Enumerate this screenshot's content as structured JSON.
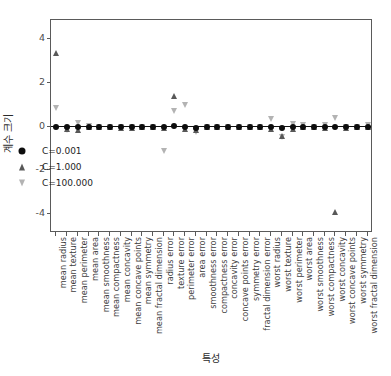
{
  "chart_data": {
    "type": "scatter",
    "title": "",
    "xlabel": "특성",
    "ylabel": "계수 크기",
    "ylim": [
      -4.85,
      4.85
    ],
    "yticks": [
      4,
      2,
      0,
      -2,
      -4
    ],
    "grid": false,
    "legend_position": "lower left",
    "zero_reference_line": true,
    "categories": [
      "mean radius",
      "mean texture",
      "mean perimeter",
      "mean area",
      "mean smoothness",
      "mean compactness",
      "mean concavity",
      "mean concave points",
      "mean symmetry",
      "mean fractal dimension",
      "radius error",
      "texture error",
      "perimeter error",
      "area error",
      "smoothness error",
      "compactness error",
      "concavity error",
      "concave points error",
      "symmetry error",
      "fractal dimension error",
      "worst radius",
      "worst texture",
      "worst perimeter",
      "worst area",
      "worst smoothness",
      "worst compactness",
      "worst concavity",
      "worst concave points",
      "worst symmetry",
      "worst fractal dimension"
    ],
    "series": [
      {
        "name": "C=0.001",
        "marker": "circle",
        "color": "#0d0d0d",
        "values": [
          -0.02,
          -0.03,
          -0.03,
          -0.02,
          0.0,
          0.0,
          -0.01,
          -0.01,
          0.0,
          0.0,
          0.0,
          0.03,
          0.0,
          -0.05,
          0.0,
          0.0,
          0.0,
          0.0,
          0.0,
          0.0,
          -0.03,
          -0.05,
          -0.03,
          -0.03,
          0.0,
          0.0,
          -0.01,
          -0.01,
          0.0,
          0.0
        ]
      },
      {
        "name": "C=1.000",
        "marker": "triangle-up",
        "color": "#585858",
        "values": [
          3.35,
          -0.12,
          -0.18,
          0.0,
          -0.02,
          -0.04,
          -0.06,
          -0.05,
          -0.03,
          0.0,
          -0.05,
          1.4,
          -0.1,
          -0.15,
          -0.02,
          -0.02,
          -0.02,
          -0.02,
          -0.02,
          0.0,
          -0.1,
          -0.45,
          -0.12,
          0.0,
          -0.03,
          -0.06,
          -3.9,
          -0.07,
          -0.04,
          -0.02
        ]
      },
      {
        "name": "C=100.000",
        "marker": "triangle-down",
        "color": "#b3b3b3",
        "values": [
          0.85,
          -0.15,
          0.15,
          0.04,
          0.0,
          0.0,
          0.0,
          0.0,
          0.0,
          0.0,
          -1.1,
          0.7,
          1.0,
          -0.25,
          0.0,
          0.0,
          0.0,
          0.0,
          0.0,
          0.0,
          0.35,
          -0.5,
          0.1,
          0.05,
          0.0,
          0.05,
          0.38,
          0.0,
          0.0,
          0.08
        ]
      }
    ]
  },
  "legend": {
    "entries": [
      {
        "label": "C=0.001",
        "marker": "circle",
        "color": "#0d0d0d"
      },
      {
        "label": "C=1.000",
        "marker": "triangle-up",
        "color": "#585858"
      },
      {
        "label": "C=100.000",
        "marker": "triangle-down",
        "color": "#b3b3b3"
      }
    ]
  }
}
